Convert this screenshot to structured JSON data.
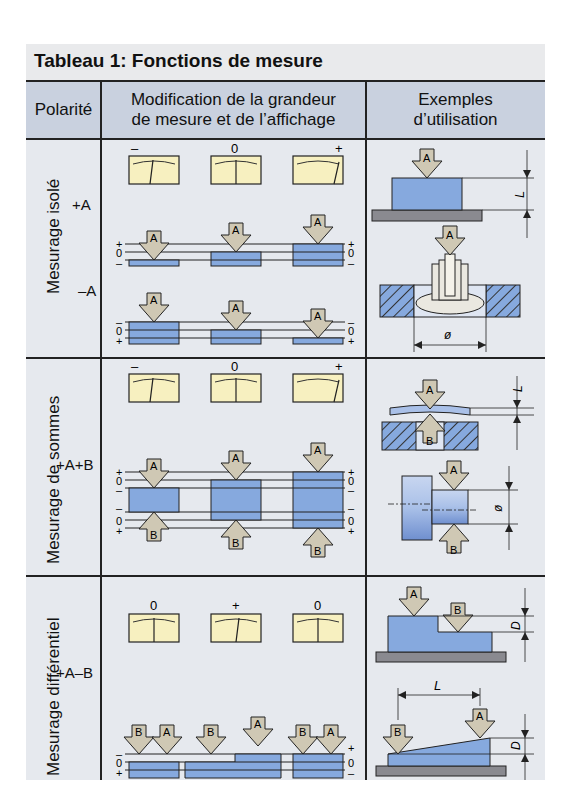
{
  "title": "Tableau 1: Fonctions de mesure",
  "header": {
    "col1": "Polarité",
    "col2_line1": "Modification de la grandeur",
    "col2_line2": "de mesure et de l’affichage",
    "col3_line1": "Exemples",
    "col3_line2": "d’utilisation"
  },
  "rows": [
    {
      "name": "Mesurage isolé",
      "polarities": [
        "+A",
        "–A"
      ],
      "meter_labels": [
        "–",
        "0",
        "+"
      ],
      "scale_labels_top": [
        "+",
        "0",
        "–"
      ],
      "scale_labels_bottom": [
        "–",
        "0",
        "+"
      ],
      "arrow_label": "A",
      "example_dims": [
        "L",
        "ø"
      ]
    },
    {
      "name": "Mesurage de sommes",
      "polarities": [
        "+A+B"
      ],
      "meter_labels": [
        "–",
        "0",
        "+"
      ],
      "scale_labels": [
        "+",
        "0",
        "–",
        "–",
        "0",
        "+"
      ],
      "arrow_labels": [
        "A",
        "B"
      ],
      "example_dims": [
        "L",
        "ø"
      ]
    },
    {
      "name": "Mesurage différentiel",
      "polarities": [
        "+A–B"
      ],
      "meter_labels": [
        "0",
        "+",
        "0"
      ],
      "scale_labels_left": [
        "–",
        "0",
        "+"
      ],
      "scale_labels_right": [
        "+",
        "0",
        "–"
      ],
      "arrow_labels": [
        "A",
        "B"
      ],
      "example_dims": [
        "D",
        "L",
        "D"
      ]
    }
  ],
  "colors": {
    "header_bg": "#c9d1df",
    "cell_bg": "#e6e9ee",
    "part_blue": "#86a9de",
    "arrow_fill": "#cfc8b4",
    "meter_fill": "#f7f0c0",
    "base_gray": "#8a8a90"
  }
}
